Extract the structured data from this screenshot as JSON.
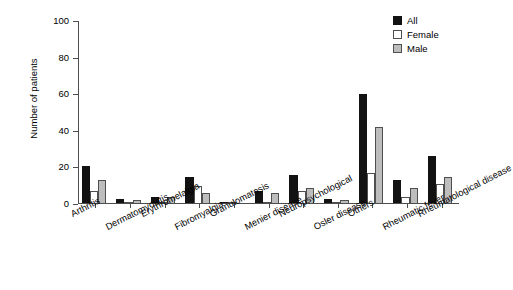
{
  "chart_data": {
    "type": "bar",
    "title": "",
    "xlabel": "",
    "ylabel": "Number of patients",
    "ylim": [
      0,
      100
    ],
    "yticks": [
      0,
      20,
      40,
      60,
      80,
      100
    ],
    "ytick_labels": [
      "0",
      "20",
      "40",
      "60",
      "80",
      "100"
    ],
    "grid": false,
    "legend_position": "top-right",
    "categories": [
      "Arthritis",
      "Dermatomyositis",
      "Erythromelalgia",
      "Fibromyalgia",
      "Granulomatosis",
      "Menier disease",
      "Neuropsychological",
      "Osler disease",
      "Others",
      "Rheumatic fever",
      "Rheumatological disease"
    ],
    "series": [
      {
        "name": "All",
        "color": "#121212",
        "values": [
          21,
          3,
          4,
          15,
          1,
          7,
          16,
          3,
          60,
          13,
          26
        ]
      },
      {
        "name": "Female",
        "color": "#ffffff",
        "values": [
          7,
          1,
          1,
          10,
          1,
          1,
          7,
          1,
          17,
          4,
          11
        ]
      },
      {
        "name": "Male",
        "color": "#bdbdbd",
        "values": [
          13,
          2,
          4,
          6,
          0,
          6,
          9,
          2,
          42,
          9,
          15
        ]
      }
    ]
  },
  "legend": {
    "items": [
      {
        "label": "All",
        "key": "all"
      },
      {
        "label": "Female",
        "key": "female"
      },
      {
        "label": "Male",
        "key": "male"
      }
    ]
  }
}
